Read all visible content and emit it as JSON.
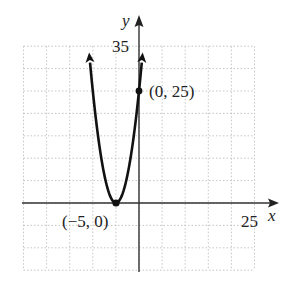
{
  "chart_data": {
    "type": "line",
    "title": "",
    "function": "f(x) = (x + 5)^2",
    "xlabel": "x",
    "ylabel": "y",
    "xlim": [
      -25,
      25
    ],
    "ylim": [
      -15,
      35
    ],
    "grid": true,
    "grid_step": 5,
    "tick_labels": {
      "x": [
        "25"
      ],
      "y": [
        "35"
      ]
    },
    "series": [
      {
        "name": "parabola",
        "x": [
          -10.9,
          -10,
          -9,
          -8,
          -7,
          -6,
          -5,
          -4,
          -3,
          -2,
          -1,
          0,
          0.9
        ],
        "y": [
          34.8,
          25,
          16,
          9,
          4,
          1,
          0,
          1,
          4,
          9,
          16,
          25,
          34.8
        ]
      }
    ],
    "points": [
      {
        "x": 0,
        "y": 25,
        "label": "(0, 25)"
      },
      {
        "x": -5,
        "y": 0,
        "label": "(−5, 0)"
      }
    ]
  },
  "labels": {
    "x_axis": "x",
    "y_axis": "y",
    "x_tick": "25",
    "y_tick": "35",
    "point_intercept": "(0, 25)",
    "point_vertex": "(−5, 0)"
  }
}
